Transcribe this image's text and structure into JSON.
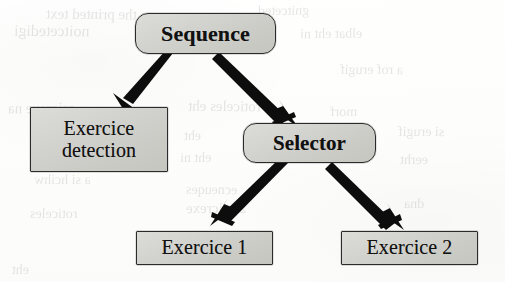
{
  "diagram": {
    "type": "behavior-tree",
    "canvas": {
      "width": 505,
      "height": 282
    },
    "colors": {
      "node_fill": "#d2d2ce",
      "node_border": "#2b2b2b",
      "edge": "#111111",
      "text": "#111111",
      "background": "#fdfdfc"
    },
    "nodes": [
      {
        "id": "sequence",
        "label": "Sequence",
        "shape": "rounded-rectangle",
        "role": "control-flow",
        "weight": "bold",
        "x": 135,
        "y": 13,
        "width": 141,
        "height": 41
      },
      {
        "id": "exercice-detection",
        "label_lines": [
          "Exercice",
          "detection"
        ],
        "label": "Exercice detection",
        "shape": "rectangle",
        "role": "action",
        "weight": "normal",
        "x": 30,
        "y": 107,
        "width": 138,
        "height": 65
      },
      {
        "id": "selector",
        "label": "Selector",
        "shape": "rounded-rectangle",
        "role": "control-flow",
        "weight": "bold",
        "x": 243,
        "y": 123,
        "width": 133,
        "height": 40
      },
      {
        "id": "exercice-1",
        "label": "Exercice 1",
        "shape": "rectangle",
        "role": "action",
        "weight": "normal",
        "x": 136,
        "y": 231,
        "width": 137,
        "height": 34
      },
      {
        "id": "exercice-2",
        "label": "Exercice 2",
        "shape": "rectangle",
        "role": "action",
        "weight": "normal",
        "x": 341,
        "y": 231,
        "width": 137,
        "height": 34
      }
    ],
    "edges": [
      {
        "id": "sequence-to-exercice-detection",
        "from": "sequence",
        "to": "exercice-detection",
        "from_point": [
          172,
          54
        ],
        "to_point": [
          128,
          110
        ],
        "style": "solid-tapered",
        "arrowhead": "filled-triangle"
      },
      {
        "id": "sequence-to-selector",
        "from": "sequence",
        "to": "selector",
        "from_point": [
          222,
          54
        ],
        "to_point": [
          290,
          124
        ],
        "style": "solid-tapered",
        "arrowhead": "filled-triangle"
      },
      {
        "id": "selector-to-exercice-1",
        "from": "selector",
        "to": "exercice-1",
        "from_point": [
          290,
          163
        ],
        "to_point": [
          224,
          231
        ],
        "style": "solid-tapered",
        "arrowhead": "filled-triangle"
      },
      {
        "id": "selector-to-exercice-2",
        "from": "selector",
        "to": "exercice-2",
        "from_point": [
          331,
          163
        ],
        "to_point": [
          396,
          231
        ],
        "style": "solid-tapered",
        "arrowhead": "filled-triangle"
      }
    ]
  },
  "scan_artifacts": {
    "description": "Faint mirrored bleed-through text from the reverse side of the scanned page",
    "ghost_lines": [
      {
        "text": "the printed text",
        "x": 46,
        "y": 6,
        "size": 15,
        "rotate": -0.6
      },
      {
        "text": "gnitceted",
        "x": 258,
        "y": 3,
        "size": 14,
        "rotate": 0.4
      },
      {
        "text": "noitcetedigi",
        "x": 14,
        "y": 22,
        "size": 16,
        "rotate": -0.4
      },
      {
        "text": "elbat eht ni",
        "x": 300,
        "y": 26,
        "size": 14,
        "rotate": 0.5
      },
      {
        "text": "a rof erugif",
        "x": 340,
        "y": 62,
        "size": 14,
        "rotate": -0.3
      },
      {
        "text": "esicrexe na",
        "x": 8,
        "y": 100,
        "size": 15,
        "rotate": 0.4
      },
      {
        "text": "roticeles eht",
        "x": 188,
        "y": 98,
        "size": 15,
        "rotate": -0.5
      },
      {
        "text": "morf",
        "x": 330,
        "y": 104,
        "size": 14,
        "rotate": 0.3
      },
      {
        "text": "eht",
        "x": 184,
        "y": 128,
        "size": 14,
        "rotate": 0.2
      },
      {
        "text": "si erugif",
        "x": 398,
        "y": 124,
        "size": 14,
        "rotate": -0.4
      },
      {
        "text": "eht ni",
        "x": 180,
        "y": 150,
        "size": 14,
        "rotate": 0.5
      },
      {
        "text": "eerht",
        "x": 400,
        "y": 152,
        "size": 14,
        "rotate": -0.2
      },
      {
        "text": "a si hcihw",
        "x": 34,
        "y": 172,
        "size": 14,
        "rotate": 0.3
      },
      {
        "text": "ecneuqes",
        "x": 186,
        "y": 182,
        "size": 14,
        "rotate": -0.5
      },
      {
        "text": "2 esicrexe",
        "x": 186,
        "y": 200,
        "size": 15,
        "rotate": 0.4
      },
      {
        "text": "roticeles",
        "x": 30,
        "y": 206,
        "size": 14,
        "rotate": -0.3
      },
      {
        "text": "dna",
        "x": 404,
        "y": 196,
        "size": 14,
        "rotate": 0.3
      },
      {
        "text": "eht",
        "x": 12,
        "y": 262,
        "size": 14,
        "rotate": -0.4
      }
    ]
  }
}
